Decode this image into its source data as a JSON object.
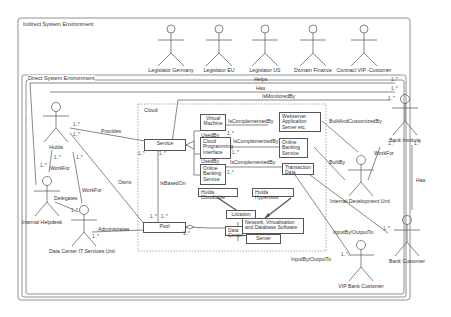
{
  "diagram": {
    "type": "UML use-case / class diagram",
    "environments": {
      "indirect": {
        "title": "Indirect System Environment"
      },
      "direct": {
        "title": "Direct System Environment"
      },
      "cloud": {
        "title": "Cloud"
      }
    },
    "indirect_actors": [
      {
        "name": "Legislator Germany"
      },
      {
        "name": "Legislator EU"
      },
      {
        "name": "Legislator US"
      },
      {
        "name": "Domain Finance"
      },
      {
        "name": "Contract VIP -Customer"
      }
    ],
    "direct_actors": {
      "hulda": "Hulda",
      "internal_helpdesk": "Internal Helpdesk",
      "dc_it_services": "Data Center IT Services Unit",
      "bank_institute": "Bank Institute",
      "internal_dev_unit": "Internal Development Unit",
      "bank_customer": "Bank Customer",
      "vip_bank_customer": "VIP Bank Customer"
    },
    "classes": {
      "service": "Service",
      "pool": "Pool",
      "virtual_machine": "Virtual Machine",
      "cloud_programming_interface": "Cloud Programming Interface",
      "online_banking_service_left": "Online Banking Service",
      "webserver": "Webserver Application Server etc.",
      "online_banking_service_right": "Online Banking Service",
      "transaction_data": "Transaction Data",
      "hulda_cloudtable": "Hulda Cloudtable",
      "hulda_hypervisor": "Hulda Hypervisor",
      "location": "Location",
      "data_center": "Data Center",
      "network_software": "Network, Virtualisation and Database Software",
      "server": "Server"
    },
    "associations": {
      "helps": "Helps",
      "has_top": "Has",
      "is_monitored_by": "IsMonitoredBy",
      "provides": "Provides",
      "owns": "Owns",
      "work_for_1": "WorkFor",
      "work_for_2": "WorkFor",
      "work_for_3": "WorkFor",
      "delegates": "Delegates",
      "administrates": "Administrates",
      "is_based_on": "IsBasedOn",
      "used_by_1": "UsedBy",
      "used_by_2": "UsedBy",
      "is_complemented_by_1": "IsComplementedBy",
      "is_complemented_by_2": "IsComplementedBy",
      "is_complemented_by_3": "IsComplementedBy",
      "built_and_customized_by": "BuiltAndCustomizedBy",
      "built_by": "BuiltBy",
      "has_right": "Has",
      "input_output_1": "InputBy/OutputTo",
      "input_output_2": "InputBy/OutputTo"
    },
    "multiplicity": "1..*",
    "multiplicity_star": "*"
  }
}
